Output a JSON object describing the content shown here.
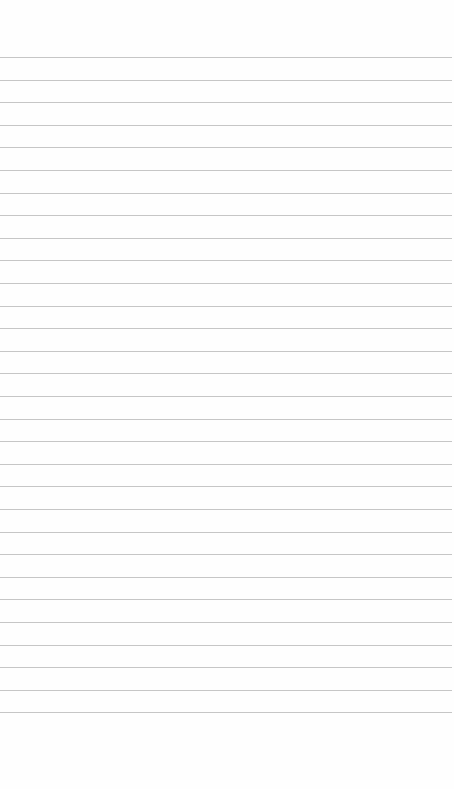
{
  "paper": {
    "type": "lined-notebook-page",
    "background_color": "#fefefe",
    "rule_color": "#c6c6c6",
    "rule_count": 30,
    "first_rule_y": 57,
    "rule_spacing": 22.6,
    "rule_width": 452
  }
}
